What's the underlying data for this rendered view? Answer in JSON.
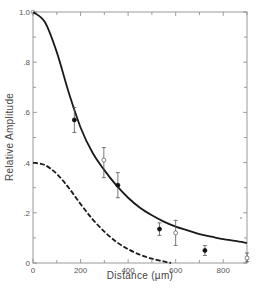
{
  "chart_data": {
    "type": "line",
    "title": "",
    "xlabel": "Distance (µm)",
    "ylabel": "Relative Amplitude",
    "xlim": [
      0,
      900
    ],
    "ylim": [
      0,
      1.0
    ],
    "x_ticks": [
      0,
      200,
      400,
      600,
      800
    ],
    "x_tick_labels": [
      "0",
      "200",
      "400",
      "600",
      "800"
    ],
    "y_ticks": [
      0,
      0.2,
      0.4,
      0.6,
      0.8,
      1.0
    ],
    "y_tick_labels": [
      "0",
      ".2",
      ".4",
      ".6",
      ".8",
      "1.0"
    ],
    "grid": false,
    "legend": null,
    "series": [
      {
        "name": "solid curve",
        "style": "solid",
        "x": [
          0,
          50,
          100,
          150,
          200,
          250,
          300,
          350,
          400,
          450,
          500,
          550,
          600,
          650,
          700,
          750,
          800,
          850,
          900
        ],
        "y": [
          1.0,
          0.96,
          0.84,
          0.68,
          0.54,
          0.44,
          0.37,
          0.31,
          0.26,
          0.22,
          0.19,
          0.165,
          0.145,
          0.13,
          0.115,
          0.105,
          0.095,
          0.088,
          0.08
        ]
      },
      {
        "name": "dashed curve",
        "style": "dashed",
        "x": [
          0,
          50,
          100,
          150,
          200,
          250,
          300,
          350,
          400,
          450,
          500,
          550,
          580
        ],
        "y": [
          0.4,
          0.39,
          0.355,
          0.3,
          0.235,
          0.175,
          0.125,
          0.085,
          0.055,
          0.033,
          0.017,
          0.006,
          0.0
        ]
      },
      {
        "name": "filled points",
        "style": "scatter-filled",
        "points": [
          {
            "x": 174,
            "y": 0.57,
            "err_low": 0.52,
            "err_high": 0.62
          },
          {
            "x": 357,
            "y": 0.31,
            "err_low": 0.26,
            "err_high": 0.36
          },
          {
            "x": 532,
            "y": 0.135,
            "err_low": 0.11,
            "err_high": 0.16
          },
          {
            "x": 723,
            "y": 0.05,
            "err_low": 0.03,
            "err_high": 0.07
          }
        ]
      },
      {
        "name": "open points",
        "style": "scatter-open",
        "points": [
          {
            "x": 298,
            "y": 0.41,
            "err_low": 0.34,
            "err_high": 0.46
          },
          {
            "x": 600,
            "y": 0.12,
            "err_low": 0.07,
            "err_high": 0.17
          },
          {
            "x": 900,
            "y": 0.02,
            "err_low": 0.005,
            "err_high": 0.04
          }
        ]
      }
    ]
  }
}
